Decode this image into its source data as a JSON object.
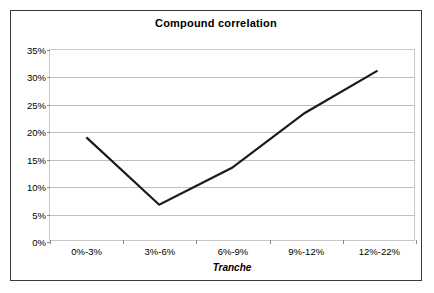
{
  "chart_data": {
    "type": "line",
    "title": "Compound correlation",
    "xlabel": "Tranche",
    "ylabel": "",
    "categories": [
      "0%-3%",
      "3%-6%",
      "6%-9%",
      "9%-12%",
      "12%-22%"
    ],
    "values": [
      18.9,
      6.5,
      13.3,
      23.4,
      31.2
    ],
    "series": [
      {
        "name": "Compound correlation",
        "values": [
          18.9,
          6.5,
          13.3,
          23.4,
          31.2
        ]
      }
    ],
    "ylim": [
      0,
      35
    ],
    "ytick_labels": [
      "0%",
      "5%",
      "10%",
      "15%",
      "20%",
      "25%",
      "30%",
      "35%"
    ],
    "ytick_values": [
      0,
      5,
      10,
      15,
      20,
      25,
      30,
      35
    ],
    "grid": true,
    "legend": false,
    "line_color": "#1a1a1a",
    "plot_background": "#ffffff",
    "gridline_color": "#bfbfbf",
    "border_color": "#3a3a3a"
  }
}
